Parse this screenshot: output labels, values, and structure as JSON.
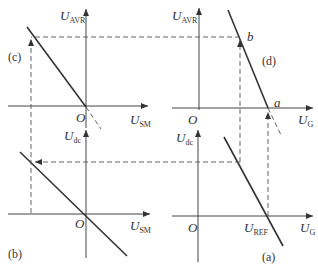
{
  "figure": {
    "panels": {
      "c": {
        "tag": "(c)",
        "y_axis": {
          "main": "U",
          "sub": "AVR"
        },
        "x_axis": {
          "main": "U",
          "sub": "SM"
        },
        "origin": "O"
      },
      "d": {
        "tag": "(d)",
        "y_axis": {
          "main": "U",
          "sub": "AVR"
        },
        "x_axis": {
          "main": "U",
          "sub": "G"
        },
        "origin": "O",
        "points": [
          "b",
          "a"
        ]
      },
      "b": {
        "tag": "(b)",
        "y_axis": {
          "main": "U",
          "sub": "dc"
        },
        "x_axis": {
          "main": "U",
          "sub": "SM"
        },
        "origin": "O"
      },
      "a": {
        "tag": "(a)",
        "y_axis": {
          "main": "U",
          "sub": "dc"
        },
        "x_axis": {
          "main": "U",
          "sub": "G"
        },
        "origin": "O",
        "x_marker": {
          "main": "U",
          "sub": "REF"
        }
      }
    },
    "colors": {
      "line": "#333333",
      "background": "#ffffff"
    }
  }
}
